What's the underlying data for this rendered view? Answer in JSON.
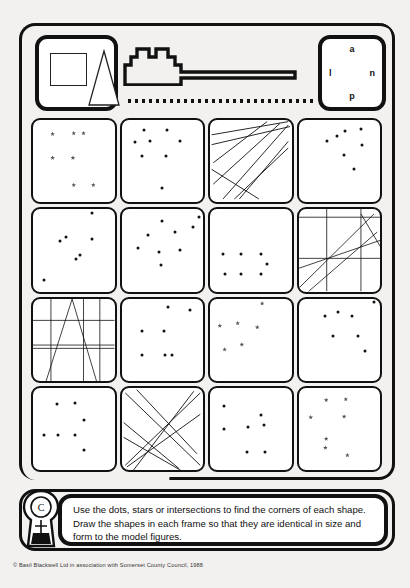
{
  "worksheet": {
    "title": "Copy the shapes worksheet",
    "header": {
      "model_panel_name": "model-figures",
      "model_shapes": [
        "square",
        "triangle"
      ],
      "castle_icon": "castle-silhouette",
      "dotted_rule": "dotted-divider",
      "letters_panel": {
        "top": "a",
        "left": "l",
        "right": "n",
        "bottom": "p"
      }
    },
    "instructions": "Use the dots, stars or intersections to find the corners of each shape. Draw the shapes in each frame so that they are identical in size and form to the model figures.",
    "copyright": "© Basil Blackwell Ltd in association with Somerset County Council, 1988",
    "logo_name": "keyhole-logo",
    "colors": {
      "ink": "#111111",
      "paper": "#ffffff",
      "background": "#f3f1ef",
      "star": "#555555"
    },
    "grid": {
      "rows": 4,
      "columns": 4,
      "cells": [
        {
          "id": "r1c1",
          "type": "stars",
          "marks": [
            [
              24,
              17
            ],
            [
              50,
              16
            ],
            [
              62,
              16
            ],
            [
              24,
              46
            ],
            [
              49,
              46
            ],
            [
              50,
              79
            ],
            [
              74,
              79
            ]
          ]
        },
        {
          "id": "r1c2",
          "type": "dots",
          "marks": [
            [
              27,
              12
            ],
            [
              56,
              12
            ],
            [
              17,
              27
            ],
            [
              35,
              26
            ],
            [
              72,
              26
            ],
            [
              25,
              44
            ],
            [
              55,
              44
            ],
            [
              50,
              83
            ]
          ]
        },
        {
          "id": "r1c3",
          "type": "lines",
          "segments": [
            [
              2,
              18,
              96,
              2
            ],
            [
              2,
              30,
              98,
              8
            ],
            [
              4,
              52,
              70,
              2
            ],
            [
              4,
              78,
              86,
              4
            ],
            [
              16,
              96,
              96,
              6
            ],
            [
              36,
              96,
              96,
              26
            ],
            [
              2,
              60,
              60,
              96
            ],
            [
              30,
              96,
              96,
              34
            ]
          ]
        },
        {
          "id": "r1c4",
          "type": "dots",
          "marks": [
            [
              57,
              13
            ],
            [
              77,
              11
            ],
            [
              47,
              19
            ],
            [
              35,
              26
            ],
            [
              78,
              30
            ],
            [
              56,
              43
            ],
            [
              68,
              60
            ]
          ]
        },
        {
          "id": "r2c1",
          "type": "dots",
          "marks": [
            [
              72,
              5
            ],
            [
              40,
              34
            ],
            [
              33,
              39
            ],
            [
              72,
              36
            ],
            [
              58,
              56
            ],
            [
              53,
              61
            ],
            [
              14,
              86
            ]
          ]
        },
        {
          "id": "r2c2",
          "type": "dots",
          "marks": [
            [
              50,
              14
            ],
            [
              95,
              10
            ],
            [
              33,
              31
            ],
            [
              66,
              28
            ],
            [
              88,
              22
            ],
            [
              20,
              47
            ],
            [
              46,
              52
            ],
            [
              72,
              50
            ],
            [
              48,
              68
            ]
          ]
        },
        {
          "id": "r2c3",
          "type": "dots",
          "marks": [
            [
              16,
              55
            ],
            [
              38,
              54
            ],
            [
              62,
              54
            ],
            [
              70,
              67
            ],
            [
              19,
              79
            ],
            [
              38,
              79
            ],
            [
              63,
              79
            ]
          ]
        },
        {
          "id": "r2c4",
          "type": "lines-grid",
          "segments": [
            [
              0,
              10,
              100,
              10
            ],
            [
              0,
              60,
              100,
              60
            ],
            [
              34,
              0,
              34,
              100
            ],
            [
              76,
              0,
              76,
              100
            ],
            [
              0,
              96,
              92,
              6
            ],
            [
              0,
              72,
              100,
              38
            ],
            [
              12,
              100,
              96,
              28
            ],
            [
              76,
              6,
              100,
              46
            ]
          ]
        },
        {
          "id": "r3c1",
          "type": "lines-grid",
          "segments": [
            [
              0,
              26,
              100,
              26
            ],
            [
              0,
              56,
              100,
              56
            ],
            [
              0,
              60,
              100,
              60
            ],
            [
              22,
              0,
              22,
              100
            ],
            [
              62,
              0,
              62,
              100
            ],
            [
              82,
              0,
              82,
              100
            ],
            [
              48,
              0,
              16,
              100
            ],
            [
              48,
              0,
              78,
              100
            ]
          ]
        },
        {
          "id": "r3c2",
          "type": "dots",
          "marks": [
            [
              57,
              10
            ],
            [
              84,
              14
            ],
            [
              25,
              40
            ],
            [
              52,
              40
            ],
            [
              25,
              69
            ],
            [
              53,
              69
            ],
            [
              62,
              69
            ]
          ]
        },
        {
          "id": "r3c3",
          "type": "stars",
          "marks": [
            [
              64,
              6
            ],
            [
              12,
              33
            ],
            [
              34,
              30
            ],
            [
              58,
              35
            ],
            [
              39,
              56
            ],
            [
              18,
              62
            ]
          ]
        },
        {
          "id": "r3c4",
          "type": "dots",
          "marks": [
            [
              93,
              4
            ],
            [
              48,
              17
            ],
            [
              33,
              21
            ],
            [
              66,
              21
            ],
            [
              42,
              46
            ],
            [
              73,
              46
            ],
            [
              82,
              64
            ]
          ]
        },
        {
          "id": "r4c1",
          "type": "dots",
          "marks": [
            [
              29,
              20
            ],
            [
              51,
              18
            ],
            [
              63,
              39
            ],
            [
              14,
              58
            ],
            [
              31,
              58
            ],
            [
              52,
              58
            ],
            [
              63,
              76
            ]
          ]
        },
        {
          "id": "r4c2",
          "type": "lines",
          "segments": [
            [
              4,
              6,
              96,
              94
            ],
            [
              96,
              6,
              4,
              94
            ],
            [
              18,
              2,
              92,
              80
            ],
            [
              2,
              60,
              72,
              100
            ],
            [
              6,
              96,
              96,
              32
            ],
            [
              14,
              100,
              88,
              4
            ],
            [
              2,
              42,
              70,
              98
            ]
          ]
        },
        {
          "id": "r4c3",
          "type": "dots",
          "marks": [
            [
              17,
              22
            ],
            [
              63,
              33
            ],
            [
              17,
              50
            ],
            [
              47,
              48
            ],
            [
              66,
              45
            ],
            [
              46,
              78
            ],
            [
              67,
              78
            ]
          ]
        },
        {
          "id": "r4c4",
          "type": "stars",
          "marks": [
            [
              34,
              15
            ],
            [
              58,
              14
            ],
            [
              15,
              36
            ],
            [
              56,
              35
            ],
            [
              34,
              62
            ],
            [
              33,
              73
            ],
            [
              60,
              82
            ]
          ]
        }
      ]
    }
  }
}
